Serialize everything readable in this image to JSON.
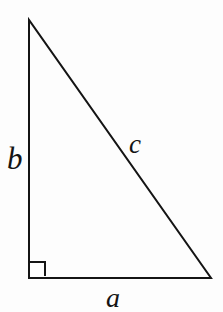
{
  "figure": {
    "name": "right-triangle",
    "background_color": "#fdfdfd",
    "stroke_color": "#141414",
    "stroke_width": 2
  },
  "geometry": {
    "vertices": {
      "apex": {
        "x": 29,
        "y": 20
      },
      "right_angle_corner": {
        "x": 29,
        "y": 278
      },
      "base_right": {
        "x": 211,
        "y": 278
      }
    },
    "right_angle_marker": {
      "x": 30,
      "y": 262,
      "size": 15
    }
  },
  "labels": {
    "vertical_leg": "b",
    "hypotenuse": "c",
    "horizontal_leg": "a"
  },
  "chart_data": {
    "type": "diagram",
    "title": "",
    "shape": "right triangle",
    "points": [
      {
        "id": "apex",
        "x": 29,
        "y": 20
      },
      {
        "id": "right_angle_corner",
        "x": 29,
        "y": 278
      },
      {
        "id": "base_right",
        "x": 211,
        "y": 278
      }
    ],
    "edges": [
      {
        "from": "apex",
        "to": "right_angle_corner",
        "label": "b",
        "role": "vertical leg"
      },
      {
        "from": "right_angle_corner",
        "to": "base_right",
        "label": "a",
        "role": "horizontal leg"
      },
      {
        "from": "apex",
        "to": "base_right",
        "label": "c",
        "role": "hypotenuse"
      }
    ],
    "annotations": [
      {
        "type": "right-angle-square",
        "at": "right_angle_corner",
        "size": 15
      }
    ]
  }
}
